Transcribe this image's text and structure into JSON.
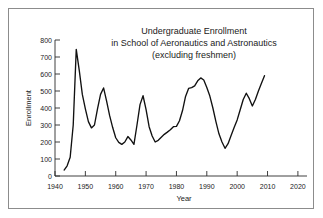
{
  "chart_data": {
    "type": "line",
    "title": "Undergraduate Enrollment\nin School of Aeronautics and Astronautics\n(excluding freshmen)",
    "title_lines": [
      "Undergraduate Enrollment",
      "in School of Aeronautics and Astronautics",
      "(excluding freshmen)"
    ],
    "xlabel": "Year",
    "ylabel": "Enrollment",
    "xlim": [
      1940,
      2023
    ],
    "ylim": [
      0,
      800
    ],
    "xticks": [
      1940,
      1950,
      1960,
      1970,
      1980,
      1990,
      2000,
      2010,
      2020
    ],
    "xtick_labels": [
      "1940",
      "1950",
      "1960",
      "1970",
      "1980",
      "1990",
      "2000",
      "2010",
      "2020"
    ],
    "yticks": [
      0,
      100,
      200,
      300,
      400,
      500,
      600,
      700,
      800
    ],
    "ytick_labels": [
      "0",
      "100",
      "200",
      "300",
      "400",
      "500",
      "600",
      "700",
      "800"
    ],
    "grid": false,
    "legend": null,
    "line_color": "#111111",
    "series": [
      {
        "name": "Enrollment",
        "x": [
          1943,
          1944,
          1945,
          1946,
          1947,
          1948,
          1949,
          1950,
          1951,
          1952,
          1953,
          1954,
          1955,
          1956,
          1957,
          1958,
          1959,
          1960,
          1961,
          1962,
          1963,
          1964,
          1965,
          1966,
          1967,
          1968,
          1969,
          1970,
          1971,
          1972,
          1973,
          1974,
          1975,
          1976,
          1977,
          1978,
          1979,
          1980,
          1981,
          1982,
          1983,
          1984,
          1985,
          1986,
          1987,
          1988,
          1989,
          1990,
          1991,
          1992,
          1993,
          1994,
          1995,
          1996,
          1997,
          1998,
          1999,
          2000,
          2001,
          2002,
          2003,
          2004,
          2005,
          2006,
          2007,
          2008,
          2009
        ],
        "values": [
          35,
          60,
          110,
          300,
          745,
          620,
          480,
          395,
          320,
          283,
          300,
          395,
          480,
          518,
          440,
          355,
          285,
          225,
          198,
          186,
          200,
          232,
          212,
          186,
          300,
          420,
          472,
          390,
          290,
          235,
          200,
          210,
          228,
          245,
          258,
          272,
          290,
          292,
          325,
          385,
          468,
          515,
          520,
          530,
          560,
          577,
          565,
          520,
          470,
          400,
          320,
          248,
          200,
          163,
          190,
          238,
          285,
          330,
          390,
          450,
          487,
          455,
          412,
          450,
          500,
          545,
          590
        ]
      }
    ]
  },
  "axes": {
    "ylabel": "Enrollment",
    "xlabel": "Year"
  }
}
